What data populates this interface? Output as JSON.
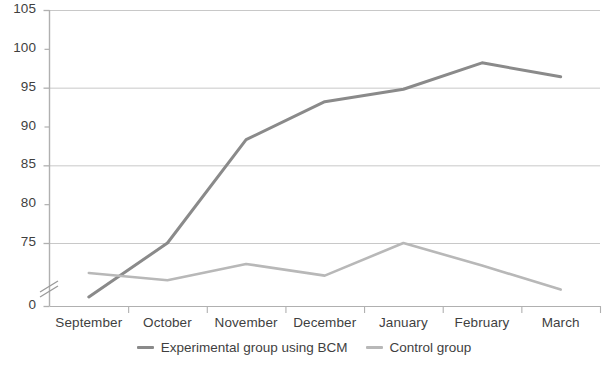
{
  "chart_data": {
    "type": "line",
    "title": "",
    "xlabel": "",
    "ylabel": "",
    "categories": [
      "September",
      "October",
      "November",
      "December",
      "January",
      "February",
      "March"
    ],
    "series": [
      {
        "name": "Experimental group using BCM",
        "color": "#8a8a8a",
        "values": [
          66,
          75,
          88.3,
          93.2,
          94.8,
          98.2,
          96.4
        ]
      },
      {
        "name": "Control group",
        "color": "#b8b8b8",
        "values": [
          69,
          70.2,
          72.3,
          70.8,
          75,
          72.1,
          69
        ]
      }
    ],
    "ylim": [
      65,
      105
    ],
    "y_ticks": [
      105,
      100,
      95,
      90,
      85,
      80,
      75
    ],
    "y_major_ticks": [
      105,
      95,
      85,
      75
    ],
    "y_minor_ticks": [
      100,
      90,
      80
    ],
    "y_tick_labels": [
      "105",
      "100",
      "95",
      "90",
      "85",
      "80",
      "75"
    ],
    "axis_break": true,
    "axis_break_label": "0",
    "grid": true,
    "legend_position": "bottom",
    "grid_color": "#c8c8c8",
    "axis_color": "#b0b0b0"
  },
  "legend": {
    "items": [
      {
        "label": "Experimental group using BCM"
      },
      {
        "label": "Control group"
      }
    ]
  }
}
